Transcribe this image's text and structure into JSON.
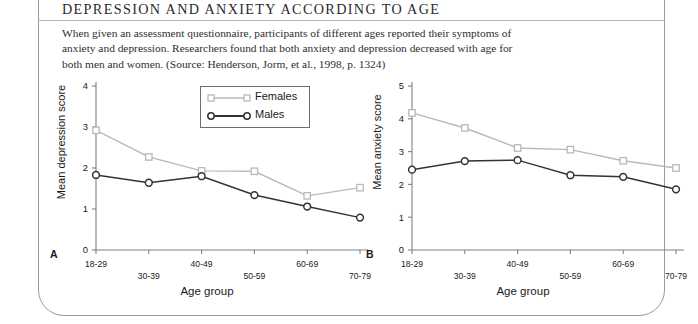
{
  "box": {
    "title": "DEPRESSION AND ANXIETY ACCORDING TO AGE",
    "body": "When given an assessment questionnaire, participants of different ages reported their symptoms of anxiety and depression. Researchers found that both anxiety and depression decreased with age for both men and women. (Source: Henderson, Jorm, et al., 1998, p. 1324)"
  },
  "legend": {
    "females_label": "Females",
    "males_label": "Males"
  },
  "colors": {
    "females": "#b9b9b9",
    "males": "#333333",
    "axis": "#808080",
    "text": "#1a1a1a",
    "border": "#9a9a9a"
  },
  "panels": {
    "a_letter": "A",
    "b_letter": "B"
  },
  "chart_data": [
    {
      "type": "line",
      "panel": "A",
      "title": "",
      "xlabel": "Age group",
      "ylabel": "Mean depression score",
      "categories": [
        "18-29",
        "30-39",
        "40-49",
        "50-59",
        "60-69",
        "70-79"
      ],
      "ylim": [
        0,
        4
      ],
      "yticks": [
        0,
        1,
        2,
        3,
        4
      ],
      "ytick_labels": [
        "0",
        "1",
        "2",
        "3",
        "4"
      ],
      "grid": false,
      "legend_position": "top-right",
      "series": [
        {
          "name": "Females",
          "marker": "square",
          "color": "#b9b9b9",
          "values": [
            2.92,
            2.27,
            1.93,
            1.92,
            1.32,
            1.52
          ]
        },
        {
          "name": "Males",
          "marker": "circle",
          "color": "#333333",
          "values": [
            1.83,
            1.64,
            1.8,
            1.34,
            1.06,
            0.79
          ]
        }
      ]
    },
    {
      "type": "line",
      "panel": "B",
      "title": "",
      "xlabel": "Age group",
      "ylabel": "Mean anxiety score",
      "categories": [
        "18-29",
        "30-39",
        "40-49",
        "50-59",
        "60-69",
        "70-79"
      ],
      "ylim": [
        0,
        5
      ],
      "yticks": [
        0,
        1,
        2,
        3,
        4,
        5
      ],
      "ytick_labels": [
        "0",
        "1",
        "2",
        "3",
        "4",
        "5"
      ],
      "grid": false,
      "legend_position": "none",
      "series": [
        {
          "name": "Females",
          "marker": "square",
          "color": "#b9b9b9",
          "values": [
            4.18,
            3.72,
            3.11,
            3.06,
            2.72,
            2.5
          ]
        },
        {
          "name": "Males",
          "marker": "circle",
          "color": "#333333",
          "values": [
            2.45,
            2.71,
            2.74,
            2.28,
            2.23,
            1.85
          ]
        }
      ]
    }
  ]
}
